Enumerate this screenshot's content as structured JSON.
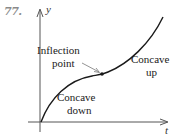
{
  "figure": {
    "number": "77.",
    "axes": {
      "x_label": "t",
      "y_label": "y"
    },
    "annotations": {
      "inflection": [
        "Inflection",
        "point"
      ],
      "concave_up": [
        "Concave",
        "up"
      ],
      "concave_down": [
        "Concave",
        "down"
      ]
    },
    "colors": {
      "curve": "#1a1a1a",
      "axis": "#555555",
      "number": "#8a8a8a"
    }
  }
}
